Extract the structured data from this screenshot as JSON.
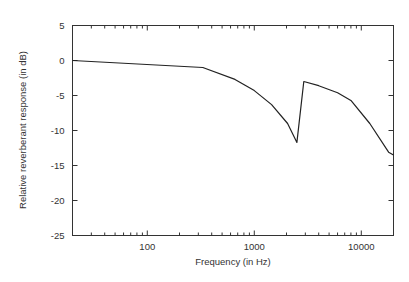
{
  "chart_data": {
    "type": "line",
    "title": "",
    "xlabel": "Frequency (in Hz)",
    "ylabel": "Relative reverberant response (in dB)",
    "xscale": "log",
    "xlim": [
      20,
      20000
    ],
    "ylim": [
      -25,
      5
    ],
    "grid": false,
    "legend": null,
    "x_ticks": [
      100,
      1000,
      10000
    ],
    "x_tick_labels": [
      "100",
      "1000",
      "10000"
    ],
    "y_ticks": [
      5,
      0,
      -5,
      -10,
      -15,
      -20,
      -25
    ],
    "y_tick_labels": [
      "5",
      "0",
      "-5",
      "-10",
      "-15",
      "-20",
      "-25"
    ],
    "series": [
      {
        "name": "reverberant response",
        "color": "#222222",
        "x": [
          20,
          330,
          660,
          1000,
          1450,
          2050,
          2500,
          2900,
          4000,
          6000,
          8000,
          12000,
          18000,
          20000
        ],
        "y": [
          0,
          -1.0,
          -2.7,
          -4.3,
          -6.3,
          -9.0,
          -11.7,
          -3.0,
          -3.6,
          -4.6,
          -5.7,
          -9.0,
          -13.1,
          -13.5
        ]
      }
    ]
  }
}
